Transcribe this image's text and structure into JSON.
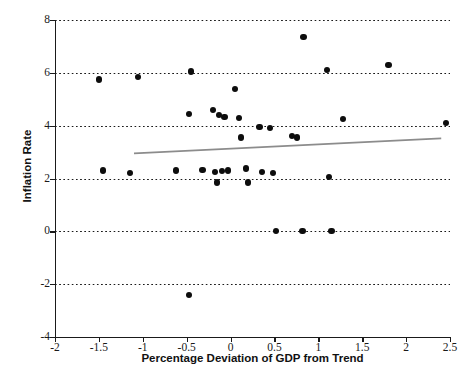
{
  "chart_data": {
    "type": "scatter",
    "title": "",
    "xlabel": "Percentage Deviation of GDP from Trend",
    "ylabel": "Inflation Rate",
    "xlim": [
      -2,
      2.5
    ],
    "ylim": [
      -4,
      8
    ],
    "xticks": [
      -2,
      -1.5,
      -1,
      -0.5,
      0,
      0.5,
      1,
      1.5,
      2,
      2.5
    ],
    "xtick_labels": [
      "-2",
      "-1.5",
      "-1",
      "-0.5",
      "0",
      "0.5",
      "1",
      "1.5",
      "2",
      "2.5"
    ],
    "yticks": [
      -4,
      -2,
      0,
      2,
      4,
      6,
      8
    ],
    "ytick_labels": [
      "-4",
      "-2",
      "0",
      "2",
      "4",
      "6",
      "8"
    ],
    "grid": "horizontal-dotted",
    "gridlines_y": [
      -2,
      0,
      2,
      4,
      6,
      8
    ],
    "legend": "none",
    "point_color": "#0d0d0d",
    "trendline_color": "#8c8c8c",
    "points": [
      {
        "x": -1.5,
        "y": 5.75
      },
      {
        "x": -1.05,
        "y": 5.85
      },
      {
        "x": -0.45,
        "y": 6.05
      },
      {
        "x": -1.45,
        "y": 2.3
      },
      {
        "x": -1.15,
        "y": 2.2
      },
      {
        "x": -0.62,
        "y": 2.3
      },
      {
        "x": -0.47,
        "y": 4.45
      },
      {
        "x": -0.47,
        "y": -2.4
      },
      {
        "x": -0.32,
        "y": 2.32
      },
      {
        "x": -0.2,
        "y": 4.6
      },
      {
        "x": -0.13,
        "y": 4.4
      },
      {
        "x": -0.07,
        "y": 4.32
      },
      {
        "x": -0.18,
        "y": 2.25
      },
      {
        "x": -0.1,
        "y": 2.28
      },
      {
        "x": -0.03,
        "y": 2.3
      },
      {
        "x": -0.15,
        "y": 1.85
      },
      {
        "x": 0.05,
        "y": 5.4
      },
      {
        "x": 0.1,
        "y": 4.28
      },
      {
        "x": 0.12,
        "y": 3.55
      },
      {
        "x": 0.18,
        "y": 2.38
      },
      {
        "x": 0.2,
        "y": 1.85
      },
      {
        "x": 0.33,
        "y": 3.95
      },
      {
        "x": 0.36,
        "y": 2.25
      },
      {
        "x": 0.45,
        "y": 3.92
      },
      {
        "x": 0.48,
        "y": 2.22
      },
      {
        "x": 0.52,
        "y": 0.0
      },
      {
        "x": 0.7,
        "y": 3.62
      },
      {
        "x": 0.76,
        "y": 3.55
      },
      {
        "x": 0.83,
        "y": 7.35
      },
      {
        "x": 0.82,
        "y": 0.0
      },
      {
        "x": 1.1,
        "y": 6.1
      },
      {
        "x": 1.12,
        "y": 2.05
      },
      {
        "x": 1.15,
        "y": 0.0
      },
      {
        "x": 1.28,
        "y": 4.25
      },
      {
        "x": 1.8,
        "y": 6.3
      },
      {
        "x": 2.45,
        "y": 4.1
      }
    ],
    "trendline": {
      "x_start": -1.1,
      "y_start": 2.95,
      "x_end": 2.4,
      "y_end": 3.52
    }
  }
}
